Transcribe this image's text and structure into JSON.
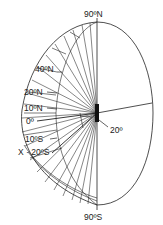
{
  "header": {
    "cut_text": "················ ·········"
  },
  "labels": {
    "north_pole": "90ºN",
    "south_pole": "90ºS",
    "lat_40n": "40ºN",
    "lat_20n": "20ºN",
    "lat_10n": "10ºN",
    "equator": "0º",
    "lat_10s": "10ºS",
    "lat_20s": "X · 20ºS",
    "angle": "20º"
  },
  "colors": {
    "line": "#222222",
    "background": "#ffffff"
  }
}
